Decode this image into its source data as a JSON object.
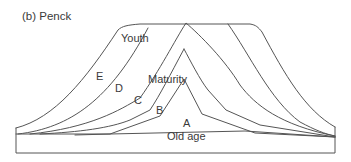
{
  "figure": {
    "title": "(b) Penck",
    "labels": {
      "youth": "Youth",
      "maturity": "Maturity",
      "old_age": "Old age",
      "e": "E",
      "d": "D",
      "c": "C",
      "b": "B",
      "a": "A"
    },
    "line_color": "#555555",
    "text_color": "#3a3a3a"
  }
}
